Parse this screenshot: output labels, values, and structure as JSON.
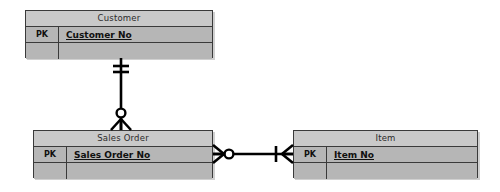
{
  "diagram": {
    "type": "entity-relationship-diagram",
    "notation": "crow's foot",
    "background_color": "#ffffff",
    "entity_fill_color": "#b6b6b6",
    "entity_header_color": "#c9c9c9",
    "entity_border_color": "#3a3a3a",
    "line_color": "#000000"
  },
  "entities": [
    {
      "id": "customer",
      "title": "Customer",
      "x": 25,
      "y": 10,
      "width": 188,
      "height": 48,
      "rows": [
        {
          "key": "PK",
          "attribute": "Customer No",
          "underline": true
        },
        {
          "key": "",
          "attribute": "",
          "underline": false
        }
      ]
    },
    {
      "id": "sales-order",
      "title": "Sales Order",
      "x": 33,
      "y": 130,
      "width": 180,
      "height": 48,
      "rows": [
        {
          "key": "PK",
          "attribute": "Sales Order No",
          "underline": true
        },
        {
          "key": "",
          "attribute": "",
          "underline": false
        }
      ]
    },
    {
      "id": "item",
      "title": "Item",
      "x": 293,
      "y": 130,
      "width": 185,
      "height": 48,
      "rows": [
        {
          "key": "PK",
          "attribute": "Item No",
          "underline": true
        },
        {
          "key": "",
          "attribute": "",
          "underline": false
        }
      ]
    }
  ],
  "relationships": [
    {
      "id": "customer-to-sales-order",
      "from": "customer",
      "to": "sales-order",
      "orientation": "vertical",
      "from_cardinality": "exactly-one",
      "to_cardinality": "zero-or-many"
    },
    {
      "id": "sales-order-to-item",
      "from": "sales-order",
      "to": "item",
      "orientation": "horizontal",
      "from_cardinality": "zero-or-many",
      "to_cardinality": "one-or-many"
    }
  ]
}
